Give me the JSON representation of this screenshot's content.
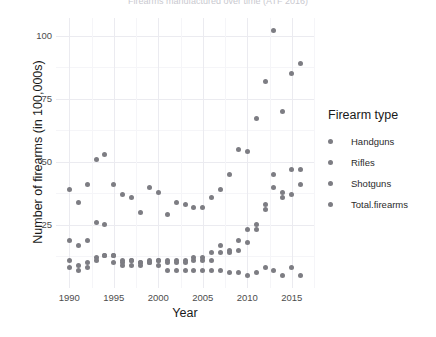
{
  "title": "Firearms manufactured over time (ATF 2016)",
  "axes": {
    "x_label": "Year",
    "y_label": "Number of firearms (in 100,000s)",
    "x_ticks": [
      1990,
      1995,
      2000,
      2005,
      2010,
      2015
    ],
    "y_ticks": [
      25,
      50,
      75,
      100
    ]
  },
  "legend": {
    "title": "Firearm type",
    "items": [
      {
        "label": "Handguns",
        "color": "#7d7d83"
      },
      {
        "label": "Rifles",
        "color": "#7d7d83"
      },
      {
        "label": "Shotguns",
        "color": "#7d7d83"
      },
      {
        "label": "Total.firearms",
        "color": "#7d7d83"
      }
    ]
  },
  "chart_data": {
    "type": "scatter",
    "title": "Firearms manufactured over time (ATF 2016)",
    "xlabel": "Year",
    "ylabel": "Number of firearms (in 100,000s)",
    "xlim": [
      1988.5,
      2017.5
    ],
    "ylim": [
      0,
      107
    ],
    "grid": true,
    "legend_position": "right",
    "point_color": "#7d7d83",
    "x": [
      1990,
      1991,
      1992,
      1993,
      1994,
      1995,
      1996,
      1997,
      1998,
      1999,
      2000,
      2001,
      2002,
      2003,
      2004,
      2005,
      2006,
      2007,
      2008,
      2009,
      2010,
      2011,
      2012,
      2013,
      2014,
      2015,
      2016
    ],
    "series": [
      {
        "name": "Handguns",
        "values": [
          19.0,
          17.0,
          19.0,
          26.0,
          25.0,
          13.0,
          11.0,
          11.0,
          10.0,
          10.0,
          11.0,
          11.0,
          11.0,
          11.0,
          12.0,
          12.0,
          14.0,
          17.0,
          15.0,
          19.0,
          23.0,
          25.0,
          33.0,
          45.0,
          38.0,
          47.0,
          47.0
        ]
      },
      {
        "name": "Rifles",
        "values": [
          11.0,
          9.0,
          10.0,
          12.0,
          13.0,
          13.0,
          10.0,
          11.0,
          10.0,
          10.0,
          11.0,
          10.0,
          10.0,
          10.0,
          11.0,
          11.0,
          11.0,
          14.0,
          14.0,
          15.0,
          18.0,
          23.0,
          31.0,
          40.0,
          36.0,
          37.0,
          41.0
        ]
      },
      {
        "name": "Shotguns",
        "values": [
          8.0,
          7.0,
          8.0,
          11.0,
          13.0,
          10.0,
          9.0,
          9.0,
          9.0,
          11.0,
          9.0,
          7.0,
          7.0,
          7.0,
          7.0,
          7.0,
          7.0,
          7.0,
          6.0,
          6.0,
          5.0,
          6.0,
          8.0,
          7.0,
          5.0,
          8.0,
          5.0
        ]
      },
      {
        "name": "Total.firearms",
        "values": [
          39.0,
          34.0,
          41.0,
          51.0,
          53.0,
          41.0,
          37.0,
          36.0,
          30.0,
          40.0,
          38.0,
          29.0,
          34.0,
          33.0,
          32.0,
          32.0,
          36.0,
          39.0,
          45.0,
          55.0,
          54.0,
          67.0,
          82.0,
          102.0,
          70.0,
          85.0,
          89.0
        ]
      }
    ]
  }
}
